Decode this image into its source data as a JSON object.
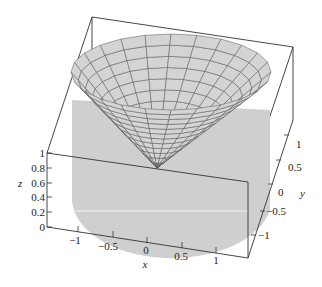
{
  "chart_data": {
    "type": "surface3d",
    "title": "",
    "xlabel": "x",
    "ylabel": "y",
    "zlabel": "z",
    "xlim": [
      -1.25,
      1.25
    ],
    "ylim": [
      -1.25,
      1.25
    ],
    "zlim": [
      0,
      1
    ],
    "x_ticks": [
      "-1",
      "-0.5",
      "0",
      "0.5",
      "1"
    ],
    "y_ticks": [
      "-1",
      "-0.5",
      "0",
      "0.5",
      "1"
    ],
    "z_ticks": [
      "0",
      "0.2",
      "0.4",
      "0.6",
      "0.8",
      "1"
    ],
    "surface": {
      "mesh": "polar",
      "radial_lines": 24,
      "rings": 12,
      "fill_color": "#d4d4d4",
      "mesh_color": "#555555"
    },
    "cylinder_color": "#cfcfcf",
    "grid": false,
    "box": true
  },
  "labels": {
    "x": "x",
    "y": "y",
    "z": "z",
    "xticks": [
      "−1",
      "−0.5",
      "0",
      "0.5",
      "1"
    ],
    "yticks": [
      "−1",
      "−0.5",
      "0",
      "0.5",
      "1"
    ],
    "zticks": [
      "0",
      "0.2",
      "0.4",
      "0.6",
      "0.8",
      "1"
    ]
  }
}
